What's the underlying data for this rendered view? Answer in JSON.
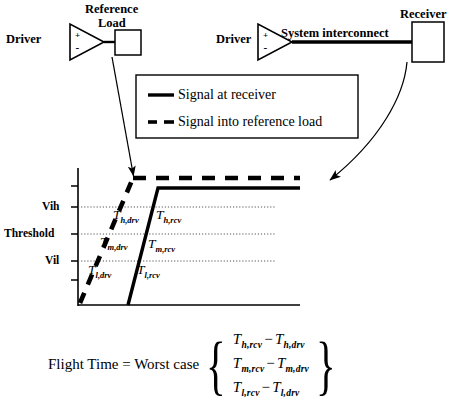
{
  "diagram": {
    "top_circuit": {
      "reference_branch": {
        "driver_label": "Driver",
        "driver_plus": "+",
        "driver_minus": "-",
        "load_label_line1": "Reference",
        "load_label_line2": "Load"
      },
      "system_branch": {
        "driver_label": "Driver",
        "driver_plus": "+",
        "driver_minus": "-",
        "interconnect_label": "System interconnect",
        "receiver_label": "Receiver"
      }
    },
    "legend": {
      "entries": [
        {
          "style": "solid",
          "label": "Signal at  receiver"
        },
        {
          "style": "dashed",
          "label": "Signal into reference load"
        }
      ]
    },
    "plot": {
      "y_axis_labels": [
        {
          "id": "vih",
          "label": "Vih"
        },
        {
          "id": "threshold",
          "label": "Threshold"
        },
        {
          "id": "vil",
          "label": "Vil"
        }
      ],
      "waveform_labels": [
        {
          "id": "t_h_drv",
          "base": "T",
          "sub": "h,drv"
        },
        {
          "id": "t_h_rcv",
          "base": "T",
          "sub": "h,rcv"
        },
        {
          "id": "t_m_drv",
          "base": "T",
          "sub": "m,drv"
        },
        {
          "id": "t_m_rcv",
          "base": "T",
          "sub": "m,rcv"
        },
        {
          "id": "t_l_drv",
          "base": "T",
          "sub": "l,drv"
        },
        {
          "id": "t_l_rcv",
          "base": "T",
          "sub": "l,rcv"
        }
      ]
    },
    "equation": {
      "lead": "Flight Time = Worst case",
      "brace_open": "{",
      "brace_close": "}",
      "rows": [
        {
          "left_base": "T",
          "left_sub": "h,rcv",
          "op": "−",
          "right_base": "T",
          "right_sub": "h,drv"
        },
        {
          "left_base": "T",
          "left_sub": "m,rcv",
          "op": "−",
          "right_base": "T",
          "right_sub": "m,drv"
        },
        {
          "left_base": "T",
          "left_sub": "l,rcv",
          "op": "−",
          "right_base": "T",
          "right_sub": "l,drv"
        }
      ]
    },
    "colors": {
      "ink": "#000000",
      "paper": "#ffffff",
      "gridline": "#808080"
    }
  }
}
